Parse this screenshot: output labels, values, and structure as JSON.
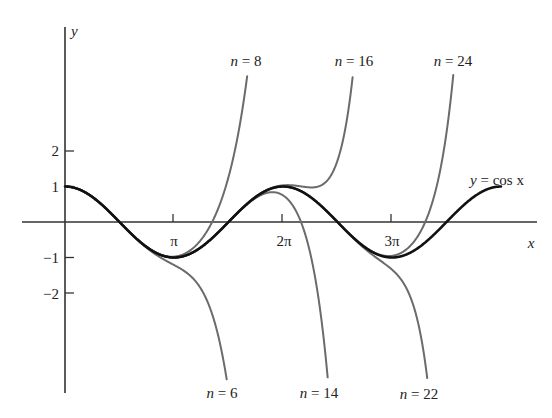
{
  "chart_data": {
    "type": "line",
    "title": "",
    "xlabel": "x",
    "ylabel": "y",
    "x_ticks": [
      {
        "value": 3.14159,
        "label": "π"
      },
      {
        "value": 6.28318,
        "label": "2π"
      },
      {
        "value": 9.42478,
        "label": "3π"
      }
    ],
    "y_ticks": [
      {
        "value": 2,
        "label": "2"
      },
      {
        "value": 1,
        "label": "1"
      },
      {
        "value": -1,
        "label": "−1"
      },
      {
        "value": -2,
        "label": "−2"
      }
    ],
    "xlim": [
      0,
      13.0
    ],
    "ylim": [
      -4.45,
      4.14
    ],
    "grid": false,
    "legend": "none (inline curve labels)",
    "series": [
      {
        "name": "y = cos x",
        "kind": "cos",
        "color": "#111111",
        "width": 2.6,
        "x_range": [
          0,
          12.566
        ],
        "sample_points": [
          [
            0,
            1
          ],
          [
            1.571,
            0
          ],
          [
            3.142,
            -1
          ],
          [
            4.712,
            0
          ],
          [
            6.283,
            1
          ],
          [
            7.854,
            0
          ],
          [
            9.425,
            -1
          ],
          [
            10.996,
            0
          ],
          [
            12.566,
            1
          ]
        ]
      },
      {
        "name": "n = 6",
        "kind": "taylor",
        "degree": 6,
        "color": "#6b6b6b",
        "width": 2.0
      },
      {
        "name": "n = 8",
        "kind": "taylor",
        "degree": 8,
        "color": "#6b6b6b",
        "width": 2.0
      },
      {
        "name": "n = 14",
        "kind": "taylor",
        "degree": 14,
        "color": "#6b6b6b",
        "width": 2.0
      },
      {
        "name": "n = 16",
        "kind": "taylor",
        "degree": 16,
        "color": "#6b6b6b",
        "width": 2.0
      },
      {
        "name": "n = 22",
        "kind": "taylor",
        "degree": 22,
        "color": "#6b6b6b",
        "width": 2.0
      },
      {
        "name": "n = 24",
        "kind": "taylor",
        "degree": 24,
        "color": "#6b6b6b",
        "width": 2.0
      }
    ],
    "annotations": [
      {
        "text": "n = 8",
        "x": 246,
        "y": 66,
        "anchor": "middle"
      },
      {
        "text": "n = 16",
        "x": 354,
        "y": 66,
        "anchor": "middle"
      },
      {
        "text": "n = 24",
        "x": 453,
        "y": 66,
        "anchor": "middle"
      },
      {
        "text": "n = 6",
        "x": 222,
        "y": 398,
        "anchor": "middle"
      },
      {
        "text": "n = 14",
        "x": 319,
        "y": 398,
        "anchor": "middle"
      },
      {
        "text": "n = 22",
        "x": 419,
        "y": 399,
        "anchor": "middle"
      },
      {
        "text": "y = cos x",
        "x": 497,
        "y": 185,
        "anchor": "middle"
      }
    ]
  },
  "axes": {
    "x_label": "x",
    "y_label": "y",
    "tick_labels": {
      "pi": "π",
      "two_pi": "2π",
      "three_pi": "3π",
      "y2": "2",
      "y1": "1",
      "ym1": "−1",
      "ym2": "−2"
    }
  },
  "labels": {
    "n8": "n = 8",
    "n16": "n = 16",
    "n24": "n = 24",
    "n6": "n = 6",
    "n14": "n = 14",
    "n22": "n = 22",
    "cos": "y = cos x"
  }
}
